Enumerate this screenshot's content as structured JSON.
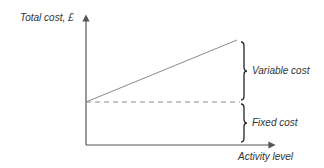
{
  "diagram": {
    "y_axis_label": "Total cost, £",
    "x_axis_label": "Activity level",
    "brace_labels": {
      "variable": "Variable cost",
      "fixed": "Fixed cost"
    },
    "colors": {
      "axis": "#555555",
      "total_cost_line": "#8a8a8a",
      "fixed_cost_dashed": "#8a8a8a",
      "brace": "#222222",
      "text": "#333333"
    }
  }
}
